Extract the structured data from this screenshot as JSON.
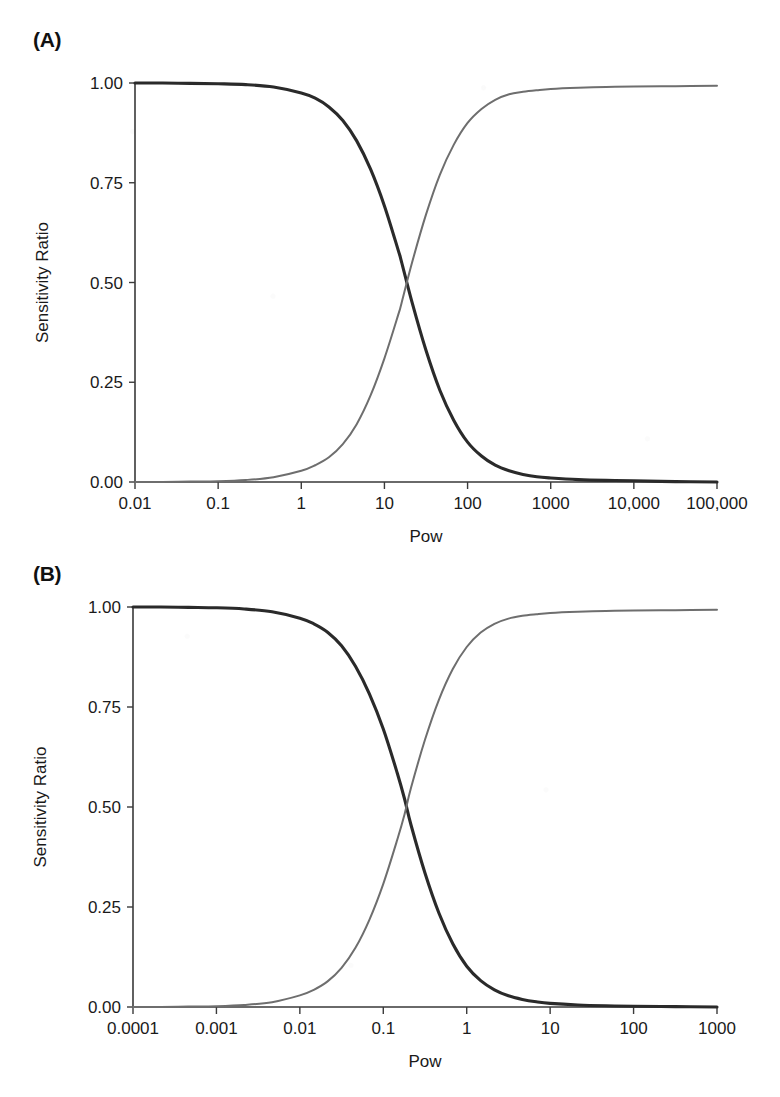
{
  "figure": {
    "background_color": "#ffffff",
    "panels": [
      {
        "label": "(A)",
        "name": "panel-a"
      },
      {
        "label": "(B)",
        "name": "panel-b"
      }
    ]
  },
  "chart_data": [
    {
      "panel": "(A)",
      "type": "line",
      "title": "",
      "xlabel": "Pow",
      "ylabel": "Sensitivity Ratio",
      "xscale": "log",
      "xlim": [
        0.01,
        100000
      ],
      "ylim": [
        0.0,
        1.0
      ],
      "grid": false,
      "legend": "none",
      "xtick_labels": [
        "0.01",
        "0.1",
        "1",
        "10",
        "100",
        "1000",
        "10,000",
        "100,000"
      ],
      "xtick_values": [
        0.01,
        0.1,
        1,
        10,
        100,
        1000,
        10000,
        100000
      ],
      "ytick_labels": [
        "0.00",
        "0.25",
        "0.50",
        "0.75",
        "1.00"
      ],
      "ytick_values": [
        0.0,
        0.25,
        0.5,
        0.75,
        1.0
      ],
      "crossover_pow": 16,
      "crossover_value": 0.5,
      "series": [
        {
          "name": "descending",
          "color": "#2a2a2a",
          "line_width": 3.1,
          "x": [
            0.01,
            0.0215,
            0.0464,
            0.1,
            0.215,
            0.464,
            1,
            1.47,
            2.15,
            3.16,
            4.64,
            6.81,
            10,
            14.7,
            16,
            21.5,
            31.6,
            46.4,
            68.1,
            100,
            147,
            215,
            316,
            464,
            681,
            1000,
            2150,
            4640,
            10000,
            31600,
            100000
          ],
          "y": [
            1.0,
            1.0,
            0.999,
            0.998,
            0.996,
            0.99,
            0.975,
            0.962,
            0.94,
            0.906,
            0.855,
            0.784,
            0.692,
            0.58,
            0.553,
            0.45,
            0.33,
            0.23,
            0.155,
            0.1,
            0.065,
            0.042,
            0.028,
            0.019,
            0.013,
            0.01,
            0.006,
            0.004,
            0.003,
            0.001,
            0.0
          ]
        },
        {
          "name": "ascending",
          "color": "#6e6e6e",
          "line_width": 2.0,
          "x": [
            0.01,
            0.0215,
            0.0464,
            0.1,
            0.215,
            0.464,
            1,
            1.47,
            2.15,
            3.16,
            4.64,
            6.81,
            10,
            14.7,
            16,
            21.5,
            31.6,
            46.4,
            68.1,
            100,
            147,
            215,
            316,
            464,
            681,
            1000,
            2150,
            4640,
            10000,
            31600,
            100000
          ],
          "y": [
            0.0,
            0.0,
            0.001,
            0.002,
            0.005,
            0.012,
            0.028,
            0.042,
            0.062,
            0.095,
            0.145,
            0.217,
            0.31,
            0.42,
            0.447,
            0.55,
            0.67,
            0.77,
            0.845,
            0.9,
            0.935,
            0.958,
            0.972,
            0.978,
            0.982,
            0.985,
            0.988,
            0.99,
            0.991,
            0.992,
            0.993
          ]
        }
      ]
    },
    {
      "panel": "(B)",
      "type": "line",
      "title": "",
      "xlabel": "Pow",
      "ylabel": "Sensitivity Ratio",
      "xscale": "log",
      "xlim": [
        0.0001,
        1000
      ],
      "ylim": [
        0.0,
        1.0
      ],
      "grid": false,
      "legend": "none",
      "xtick_labels": [
        "0.0001",
        "0.001",
        "0.01",
        "0.1",
        "1",
        "10",
        "100",
        "1000"
      ],
      "xtick_values": [
        0.0001,
        0.001,
        0.01,
        0.1,
        1,
        10,
        100,
        1000
      ],
      "ytick_labels": [
        "0.00",
        "0.25",
        "0.50",
        "0.75",
        "1.00"
      ],
      "ytick_values": [
        0.0,
        0.25,
        0.5,
        0.75,
        1.0
      ],
      "crossover_pow": 0.18,
      "crossover_value": 0.5,
      "series": [
        {
          "name": "descending",
          "color": "#2a2a2a",
          "line_width": 3.1,
          "x": [
            0.0001,
            0.000215,
            0.000464,
            0.001,
            0.00215,
            0.00464,
            0.01,
            0.0147,
            0.0215,
            0.0316,
            0.0464,
            0.0681,
            0.1,
            0.147,
            0.18,
            0.215,
            0.316,
            0.464,
            0.681,
            1,
            1.47,
            2.15,
            3.16,
            4.64,
            6.81,
            10,
            21.5,
            46.4,
            100,
            316,
            1000
          ],
          "y": [
            1.0,
            1.0,
            0.999,
            0.998,
            0.995,
            0.988,
            0.972,
            0.958,
            0.937,
            0.903,
            0.852,
            0.783,
            0.695,
            0.585,
            0.52,
            0.455,
            0.335,
            0.235,
            0.158,
            0.102,
            0.066,
            0.043,
            0.028,
            0.019,
            0.013,
            0.009,
            0.005,
            0.003,
            0.002,
            0.001,
            0.0
          ]
        },
        {
          "name": "ascending",
          "color": "#6e6e6e",
          "line_width": 2.0,
          "x": [
            0.0001,
            0.000215,
            0.000464,
            0.001,
            0.00215,
            0.00464,
            0.01,
            0.0147,
            0.0215,
            0.0316,
            0.0464,
            0.0681,
            0.1,
            0.147,
            0.18,
            0.215,
            0.316,
            0.464,
            0.681,
            1,
            1.47,
            2.15,
            3.16,
            4.64,
            6.81,
            10,
            21.5,
            46.4,
            100,
            316,
            1000
          ],
          "y": [
            0.0,
            0.0,
            0.001,
            0.002,
            0.005,
            0.012,
            0.029,
            0.043,
            0.064,
            0.098,
            0.148,
            0.218,
            0.308,
            0.418,
            0.482,
            0.548,
            0.668,
            0.768,
            0.845,
            0.9,
            0.936,
            0.958,
            0.971,
            0.978,
            0.982,
            0.985,
            0.988,
            0.99,
            0.991,
            0.992,
            0.993
          ]
        }
      ]
    }
  ]
}
